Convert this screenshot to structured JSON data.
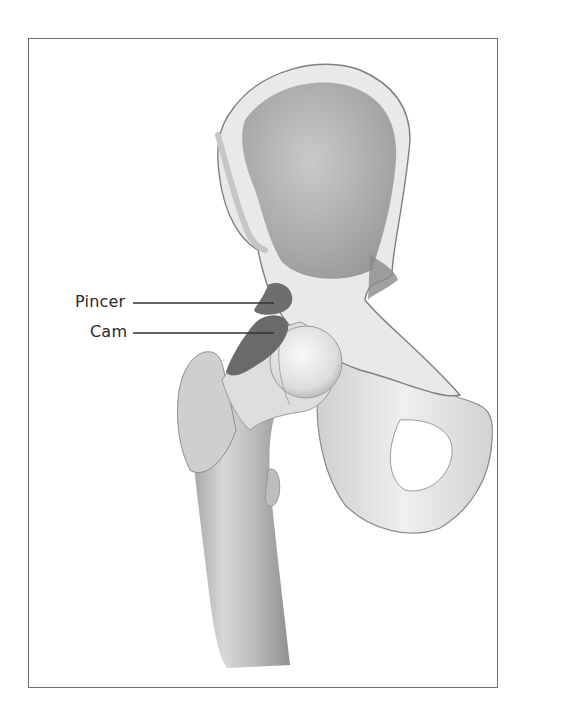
{
  "figure": {
    "labels": [
      {
        "text": "Pincer",
        "x": 75,
        "y": 292,
        "line_from": 133,
        "line_to": 274,
        "line_y": 303
      },
      {
        "text": "Cam",
        "x": 90,
        "y": 322,
        "line_from": 133,
        "line_to": 274,
        "line_y": 333
      }
    ]
  },
  "colors": {
    "border": "#6f6f6f",
    "bone_light": "#e4e4e4",
    "bone_mid": "#bdbdbd",
    "bone_dark": "#8c8c8c",
    "lesion": "#6e6e6e",
    "text": "#2a2a2a"
  }
}
